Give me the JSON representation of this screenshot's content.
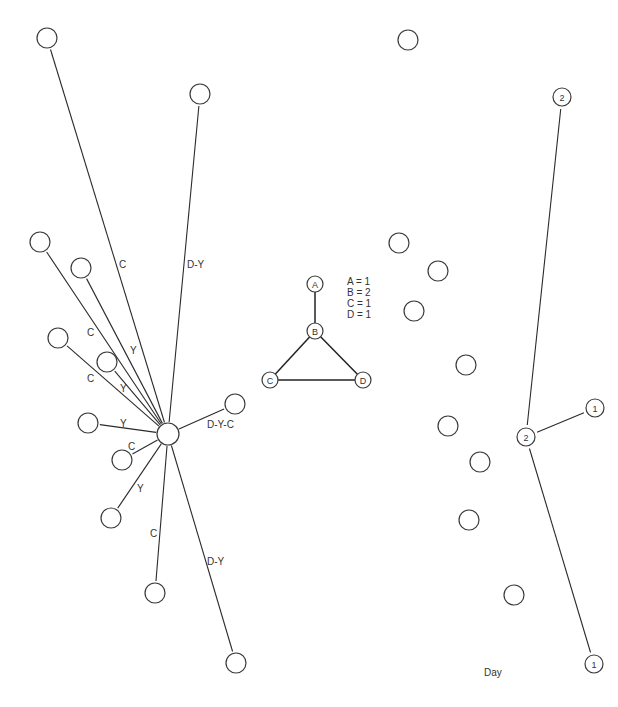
{
  "diagram": {
    "caption": "Day",
    "node_radius": 10,
    "colors": {
      "stroke": "#3a3a3a",
      "line": "#2b2b2b",
      "text": "#333333",
      "background": "#ffffff"
    },
    "left_star": {
      "hub": {
        "x": 168,
        "y": 434
      },
      "spokes": [
        {
          "to": {
            "x": 47,
            "y": 38
          },
          "label": "C",
          "lx": 119,
          "ly": 268
        },
        {
          "to": {
            "x": 200,
            "y": 94
          },
          "label": "D-Y",
          "lx": 187,
          "ly": 268
        },
        {
          "to": {
            "x": 40,
            "y": 242
          },
          "label": "C",
          "lx": 87,
          "ly": 336
        },
        {
          "to": {
            "x": 81,
            "y": 268
          },
          "label": "Y",
          "lx": 130,
          "ly": 354
        },
        {
          "to": {
            "x": 58,
            "y": 338
          },
          "label": "C",
          "lx": 87,
          "ly": 382
        },
        {
          "to": {
            "x": 107,
            "y": 362
          },
          "label": "Y",
          "lx": 120,
          "ly": 392
        },
        {
          "to": {
            "x": 88,
            "y": 423
          },
          "label": "Y",
          "lx": 120,
          "ly": 427
        },
        {
          "to": {
            "x": 122,
            "y": 460
          },
          "label": "C",
          "lx": 128,
          "ly": 450
        },
        {
          "to": {
            "x": 111,
            "y": 518
          },
          "label": "Y",
          "lx": 137,
          "ly": 492
        },
        {
          "to": {
            "x": 155,
            "y": 593
          },
          "label": "C",
          "lx": 150,
          "ly": 537
        },
        {
          "to": {
            "x": 236,
            "y": 663
          },
          "label": "D-Y",
          "lx": 207,
          "ly": 565
        },
        {
          "to": {
            "x": 235,
            "y": 404
          },
          "label": "D-Y-C",
          "lx": 207,
          "ly": 428
        }
      ]
    },
    "triangle_graph": {
      "nodes": [
        {
          "id": "A",
          "x": 315,
          "y": 284
        },
        {
          "id": "B",
          "x": 315,
          "y": 331
        },
        {
          "id": "C",
          "x": 270,
          "y": 380
        },
        {
          "id": "D",
          "x": 363,
          "y": 380
        }
      ],
      "edges": [
        [
          "A",
          "B"
        ],
        [
          "B",
          "C"
        ],
        [
          "B",
          "D"
        ],
        [
          "C",
          "D"
        ]
      ],
      "legend": [
        "A = 1",
        "B = 2",
        "C = 1",
        "D = 1"
      ]
    },
    "isolated_nodes": [
      {
        "x": 408,
        "y": 40
      },
      {
        "x": 399,
        "y": 243
      },
      {
        "x": 438,
        "y": 271
      },
      {
        "x": 414,
        "y": 311
      },
      {
        "x": 466,
        "y": 365
      },
      {
        "x": 448,
        "y": 426
      },
      {
        "x": 480,
        "y": 462
      },
      {
        "x": 469,
        "y": 520
      },
      {
        "x": 514,
        "y": 595
      }
    ],
    "right_tree": {
      "nodes": [
        {
          "id": "top",
          "label": "2",
          "x": 562,
          "y": 97
        },
        {
          "id": "center",
          "label": "2",
          "x": 526,
          "y": 437
        },
        {
          "id": "right",
          "label": "1",
          "x": 595,
          "y": 408
        },
        {
          "id": "bottom",
          "label": "1",
          "x": 594,
          "y": 664
        }
      ],
      "edges": [
        [
          "top",
          "center"
        ],
        [
          "center",
          "right"
        ],
        [
          "center",
          "bottom"
        ]
      ]
    },
    "caption_pos": {
      "x": 484,
      "y": 676
    }
  }
}
